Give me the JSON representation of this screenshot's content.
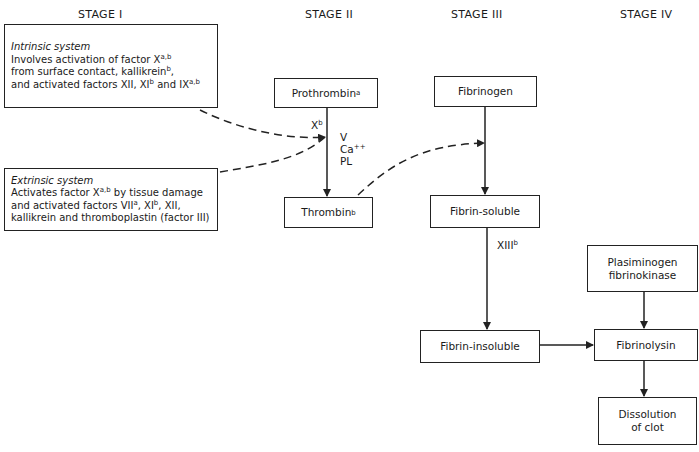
{
  "stages": [
    "STAGE I",
    "STAGE II",
    "STAGE III",
    "STAGE IV"
  ],
  "intrinsic": {
    "title": "Intrinsic system",
    "lines": [
      {
        "text": "Involves activation of factor X",
        "sup": "a,b",
        "after": ""
      },
      {
        "text": "from surface contact, kallikrein",
        "sup": "b",
        "after": ","
      },
      {
        "text": "and activated factors XII, XI",
        "sup": "b",
        "after": " and IX",
        "sup2": "a,b"
      }
    ]
  },
  "extrinsic": {
    "title": "Extrinsic system",
    "lines": [
      {
        "text": "Activates factor X",
        "sup": "a,b",
        "after": " by tissue damage"
      },
      {
        "text": "and activated factors VII",
        "sup": "a",
        "after": ", XI",
        "sup2": "b",
        "after2": ", XII,"
      },
      {
        "text": "kallikrein and thromboplastin (factor III)"
      }
    ]
  },
  "nodes": {
    "prothrombin": {
      "label": "Prothrombin",
      "sup": "a"
    },
    "thrombin": {
      "label": "Thrombin",
      "sup": "b"
    },
    "fibrinogen": {
      "label": "Fibrinogen"
    },
    "fibrin_soluble": {
      "label": "Fibrin-soluble"
    },
    "fibrin_insoluble": {
      "label": "Fibrin-insoluble"
    },
    "plasminogen": {
      "line1": "Plasiminogen",
      "line2": "fibrinokinase"
    },
    "fibrinolysin": {
      "label": "Fibrinolysin"
    },
    "dissolution": {
      "line1": "Dissolution",
      "line2": "of clot"
    }
  },
  "edge_labels": {
    "xb": {
      "text": "X",
      "sup": "b"
    },
    "cofactors": [
      "V",
      "Ca",
      "PL"
    ],
    "ca_sup": "++",
    "xiii": {
      "text": "XIII",
      "sup": "b"
    }
  }
}
